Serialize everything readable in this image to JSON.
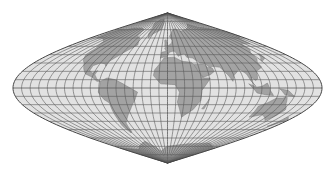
{
  "map": {
    "projection": "Sinusoidal",
    "graticule_interval_deg": 10,
    "colors": {
      "background": "#ffffff",
      "ocean": "#e2e2e2",
      "land": "#a3a3a3",
      "land_stroke": "#7a7a7a",
      "graticule": "#5a5a5a",
      "outline": "#444444"
    },
    "continents": [
      {
        "name": "north-america",
        "coords": [
          [
            -168,
            66
          ],
          [
            -160,
            70
          ],
          [
            -140,
            70
          ],
          [
            -125,
            72
          ],
          [
            -95,
            72
          ],
          [
            -80,
            70
          ],
          [
            -75,
            62
          ],
          [
            -64,
            60
          ],
          [
            -56,
            52
          ],
          [
            -66,
            45
          ],
          [
            -70,
            42
          ],
          [
            -76,
            36
          ],
          [
            -81,
            31
          ],
          [
            -80,
            26
          ],
          [
            -83,
            29
          ],
          [
            -90,
            30
          ],
          [
            -97,
            27
          ],
          [
            -97,
            21
          ],
          [
            -92,
            18
          ],
          [
            -87,
            21
          ],
          [
            -88,
            16
          ],
          [
            -83,
            10
          ],
          [
            -79,
            8
          ],
          [
            -83,
            8
          ],
          [
            -90,
            13
          ],
          [
            -100,
            17
          ],
          [
            -106,
            23
          ],
          [
            -112,
            30
          ],
          [
            -117,
            33
          ],
          [
            -124,
            40
          ],
          [
            -124,
            48
          ],
          [
            -133,
            56
          ],
          [
            -150,
            60
          ],
          [
            -165,
            60
          ],
          [
            -168,
            66
          ]
        ]
      },
      {
        "name": "greenland",
        "coords": [
          [
            -45,
            60
          ],
          [
            -52,
            65
          ],
          [
            -56,
            72
          ],
          [
            -70,
            78
          ],
          [
            -60,
            82
          ],
          [
            -30,
            83
          ],
          [
            -20,
            78
          ],
          [
            -22,
            70
          ],
          [
            -40,
            65
          ],
          [
            -45,
            60
          ]
        ]
      },
      {
        "name": "south-america",
        "coords": [
          [
            -79,
            8
          ],
          [
            -72,
            12
          ],
          [
            -62,
            10
          ],
          [
            -52,
            5
          ],
          [
            -35,
            -5
          ],
          [
            -39,
            -14
          ],
          [
            -48,
            -26
          ],
          [
            -58,
            -36
          ],
          [
            -65,
            -42
          ],
          [
            -68,
            -52
          ],
          [
            -72,
            -54
          ],
          [
            -75,
            -46
          ],
          [
            -73,
            -37
          ],
          [
            -71,
            -18
          ],
          [
            -76,
            -14
          ],
          [
            -81,
            -5
          ],
          [
            -79,
            2
          ],
          [
            -79,
            8
          ]
        ]
      },
      {
        "name": "africa",
        "coords": [
          [
            -17,
            15
          ],
          [
            -16,
            22
          ],
          [
            -9,
            31
          ],
          [
            -5,
            36
          ],
          [
            10,
            37
          ],
          [
            20,
            32
          ],
          [
            32,
            31
          ],
          [
            35,
            28
          ],
          [
            43,
            12
          ],
          [
            51,
            12
          ],
          [
            40,
            -3
          ],
          [
            40,
            -15
          ],
          [
            33,
            -26
          ],
          [
            20,
            -35
          ],
          [
            17,
            -29
          ],
          [
            12,
            -17
          ],
          [
            14,
            -5
          ],
          [
            9,
            4
          ],
          [
            -8,
            5
          ],
          [
            -17,
            15
          ]
        ]
      },
      {
        "name": "eurasia",
        "coords": [
          [
            -10,
            36
          ],
          [
            -9,
            43
          ],
          [
            -2,
            44
          ],
          [
            -5,
            48
          ],
          [
            2,
            51
          ],
          [
            8,
            54
          ],
          [
            10,
            57
          ],
          [
            5,
            62
          ],
          [
            15,
            69
          ],
          [
            25,
            71
          ],
          [
            40,
            68
          ],
          [
            60,
            70
          ],
          [
            80,
            73
          ],
          [
            100,
            77
          ],
          [
            120,
            73
          ],
          [
            140,
            72
          ],
          [
            160,
            70
          ],
          [
            180,
            68
          ],
          [
            180,
            62
          ],
          [
            165,
            60
          ],
          [
            160,
            53
          ],
          [
            142,
            53
          ],
          [
            138,
            46
          ],
          [
            130,
            42
          ],
          [
            127,
            35
          ],
          [
            122,
            31
          ],
          [
            121,
            25
          ],
          [
            110,
            20
          ],
          [
            107,
            11
          ],
          [
            104,
            9
          ],
          [
            100,
            13
          ],
          [
            99,
            8
          ],
          [
            103,
            2
          ],
          [
            98,
            9
          ],
          [
            96,
            17
          ],
          [
            91,
            22
          ],
          [
            88,
            21
          ],
          [
            80,
            15
          ],
          [
            77,
            8
          ],
          [
            73,
            16
          ],
          [
            67,
            25
          ],
          [
            57,
            26
          ],
          [
            55,
            24
          ],
          [
            52,
            27
          ],
          [
            48,
            30
          ],
          [
            44,
            30
          ],
          [
            36,
            36
          ],
          [
            28,
            37
          ],
          [
            26,
            41
          ],
          [
            20,
            40
          ],
          [
            16,
            38
          ],
          [
            12,
            44
          ],
          [
            8,
            44
          ],
          [
            3,
            43
          ],
          [
            -1,
            37
          ],
          [
            -6,
            37
          ],
          [
            -10,
            36
          ]
        ]
      },
      {
        "name": "arabia",
        "coords": [
          [
            35,
            28
          ],
          [
            38,
            20
          ],
          [
            43,
            13
          ],
          [
            52,
            16
          ],
          [
            58,
            20
          ],
          [
            57,
            24
          ],
          [
            51,
            25
          ],
          [
            48,
            29
          ],
          [
            35,
            28
          ]
        ]
      },
      {
        "name": "australia",
        "coords": [
          [
            114,
            -22
          ],
          [
            122,
            -18
          ],
          [
            130,
            -12
          ],
          [
            137,
            -12
          ],
          [
            142,
            -11
          ],
          [
            146,
            -19
          ],
          [
            153,
            -26
          ],
          [
            151,
            -33
          ],
          [
            146,
            -39
          ],
          [
            138,
            -35
          ],
          [
            130,
            -32
          ],
          [
            116,
            -35
          ],
          [
            114,
            -22
          ]
        ]
      },
      {
        "name": "borneo-indonesia",
        "coords": [
          [
            95,
            5
          ],
          [
            105,
            -6
          ],
          [
            115,
            -8
          ],
          [
            125,
            -9
          ],
          [
            120,
            -3
          ],
          [
            117,
            6
          ],
          [
            110,
            2
          ],
          [
            104,
            1
          ],
          [
            95,
            5
          ]
        ]
      },
      {
        "name": "new-guinea",
        "coords": [
          [
            131,
            -1
          ],
          [
            141,
            -3
          ],
          [
            150,
            -10
          ],
          [
            143,
            -9
          ],
          [
            138,
            -8
          ],
          [
            131,
            -1
          ]
        ]
      },
      {
        "name": "japan",
        "coords": [
          [
            130,
            32
          ],
          [
            135,
            34
          ],
          [
            140,
            36
          ],
          [
            142,
            41
          ],
          [
            140,
            41
          ],
          [
            136,
            37
          ],
          [
            131,
            34
          ],
          [
            130,
            32
          ]
        ]
      },
      {
        "name": "uk",
        "coords": [
          [
            -5,
            50
          ],
          [
            1,
            51
          ],
          [
            -1,
            55
          ],
          [
            -3,
            58
          ],
          [
            -6,
            57
          ],
          [
            -5,
            54
          ],
          [
            -5,
            50
          ]
        ]
      },
      {
        "name": "madagascar",
        "coords": [
          [
            44,
            -25
          ],
          [
            49,
            -16
          ],
          [
            50,
            -13
          ],
          [
            47,
            -25
          ],
          [
            44,
            -25
          ]
        ]
      },
      {
        "name": "new-zealand",
        "coords": [
          [
            172,
            -35
          ],
          [
            178,
            -38
          ],
          [
            175,
            -41
          ],
          [
            171,
            -45
          ],
          [
            167,
            -46
          ],
          [
            172,
            -41
          ],
          [
            172,
            -35
          ]
        ]
      },
      {
        "name": "antarctica",
        "coords": [
          [
            -180,
            -72
          ],
          [
            -120,
            -74
          ],
          [
            -60,
            -64
          ],
          [
            -30,
            -76
          ],
          [
            0,
            -70
          ],
          [
            60,
            -67
          ],
          [
            120,
            -66
          ],
          [
            170,
            -72
          ],
          [
            180,
            -72
          ],
          [
            180,
            -90
          ],
          [
            -180,
            -90
          ],
          [
            -180,
            -72
          ]
        ]
      }
    ]
  }
}
